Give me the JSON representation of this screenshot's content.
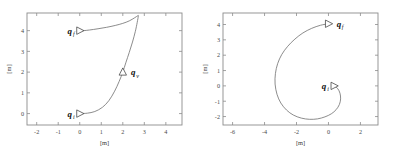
{
  "figure": {
    "axis_unit_label": "[m]",
    "panels": [
      {
        "id": "left",
        "xlabel": "[m]",
        "ylabel": "[m]",
        "xticks": [
          "-2",
          "-1",
          "0",
          "1",
          "2",
          "3",
          "4"
        ],
        "xtick_values": [
          -2,
          -1,
          0,
          1,
          2,
          3,
          4
        ],
        "yticks": [
          "0",
          "1",
          "2",
          "3",
          "4"
        ],
        "ytick_values": [
          0,
          1,
          2,
          3,
          4
        ],
        "xlim": [
          -2.45,
          4.75
        ],
        "ylim": [
          -0.55,
          4.85
        ],
        "points": [
          {
            "name": "q_f",
            "base": "q",
            "sub": "f",
            "x": 0.0,
            "y": 4.0,
            "heading": "right",
            "label_side": "left"
          },
          {
            "name": "q_v",
            "base": "q",
            "sub": "v",
            "x": 2.0,
            "y": 2.0,
            "heading": "up",
            "label_side": "right"
          },
          {
            "name": "q_i",
            "base": "q",
            "sub": "i",
            "x": 0.0,
            "y": 0.0,
            "heading": "right",
            "label_side": "left"
          }
        ]
      },
      {
        "id": "right",
        "xlabel": "[m]",
        "ylabel": "[m]",
        "xticks": [
          "-6",
          "-4",
          "-2",
          "0",
          "2"
        ],
        "xtick_values": [
          -6,
          -4,
          -2,
          0,
          2
        ],
        "yticks": [
          "-2",
          "-1",
          "0",
          "1",
          "2",
          "3",
          "4"
        ],
        "ytick_values": [
          -2,
          -1,
          0,
          1,
          2,
          3,
          4
        ],
        "xlim": [
          -6.6,
          3.1
        ],
        "ylim": [
          -2.55,
          4.75
        ],
        "points": [
          {
            "name": "q_f",
            "base": "q",
            "sub": "f",
            "x": 0.0,
            "y": 4.05,
            "heading": "right",
            "label_side": "right"
          },
          {
            "name": "q_i",
            "base": "q",
            "sub": "i",
            "x": 0.35,
            "y": 0.0,
            "heading": "right",
            "label_side": "left"
          }
        ]
      }
    ]
  },
  "chart_data": [
    {
      "type": "line",
      "title": "",
      "xlabel": "[m]",
      "ylabel": "[m]",
      "xlim": [
        -2.45,
        4.75
      ],
      "ylim": [
        -0.55,
        4.85
      ],
      "xticks": [
        -2,
        -1,
        0,
        1,
        2,
        3,
        4
      ],
      "yticks": [
        0,
        1,
        2,
        3,
        4
      ],
      "grid": false,
      "legend": "none",
      "series": [
        {
          "name": "path",
          "x": [
            0.0,
            0.35,
            0.7,
            1.05,
            1.35,
            1.62,
            1.83,
            2.0,
            2.14,
            2.3,
            2.45,
            2.58,
            2.67,
            2.72,
            2.7,
            2.55,
            2.3,
            2.0,
            1.65,
            1.25,
            0.85,
            0.45,
            0.18,
            0.0
          ],
          "y": [
            0.0,
            0.02,
            0.1,
            0.3,
            0.62,
            1.08,
            1.55,
            2.0,
            2.45,
            2.95,
            3.45,
            3.95,
            4.4,
            4.7,
            4.72,
            4.62,
            4.47,
            4.35,
            4.25,
            4.16,
            4.09,
            4.03,
            4.0,
            4.0
          ]
        }
      ],
      "annotations": [
        {
          "text": "q_f",
          "x": 0.0,
          "y": 4.0,
          "marker": "triangle-right"
        },
        {
          "text": "q_v",
          "x": 2.0,
          "y": 2.0,
          "marker": "triangle-up"
        },
        {
          "text": "q_i",
          "x": 0.0,
          "y": 0.0,
          "marker": "triangle-right"
        }
      ]
    },
    {
      "type": "line",
      "title": "",
      "xlabel": "[m]",
      "ylabel": "[m]",
      "xlim": [
        -6.6,
        3.1
      ],
      "ylim": [
        -2.55,
        4.75
      ],
      "xticks": [
        -6,
        -4,
        -2,
        0,
        2
      ],
      "yticks": [
        -2,
        -1,
        0,
        1,
        2,
        3,
        4
      ],
      "grid": false,
      "legend": "none",
      "series": [
        {
          "name": "path",
          "x": [
            0.35,
            0.58,
            0.72,
            0.76,
            0.68,
            0.48,
            0.18,
            -0.22,
            -0.68,
            -1.18,
            -1.7,
            -2.2,
            -2.62,
            -2.98,
            -3.22,
            -3.34,
            -3.32,
            -3.18,
            -2.92,
            -2.55,
            -2.1,
            -1.6,
            -1.05,
            -0.5,
            0.0
          ],
          "y": [
            0.0,
            -0.18,
            -0.48,
            -0.85,
            -1.22,
            -1.55,
            -1.82,
            -2.02,
            -2.15,
            -2.18,
            -2.1,
            -1.9,
            -1.58,
            -1.12,
            -0.55,
            0.12,
            0.8,
            1.45,
            2.05,
            2.58,
            3.05,
            3.45,
            3.75,
            3.95,
            4.05
          ]
        }
      ],
      "annotations": [
        {
          "text": "q_f",
          "x": 0.0,
          "y": 4.05,
          "marker": "triangle-right"
        },
        {
          "text": "q_i",
          "x": 0.35,
          "y": 0.0,
          "marker": "triangle-right"
        }
      ]
    }
  ]
}
